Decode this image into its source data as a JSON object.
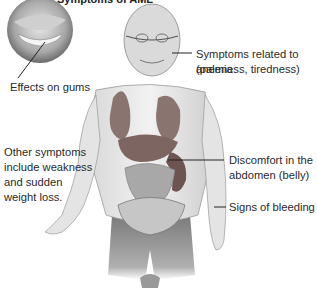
{
  "title": "Symptoms of AML",
  "labels": {
    "gums": "Effects on gums",
    "anemia_line1": "Symptoms related to anemia",
    "anemia_line2": "(paleness, tiredness)",
    "other_line1": "Other symptoms",
    "other_line2": "include weakness",
    "other_line3": "and sudden",
    "other_line4": "weight loss.",
    "abdomen_line1": "Discomfort in the",
    "abdomen_line2": "abdomen (belly)",
    "bleeding": "Signs of bleeding"
  },
  "colors": {
    "organ": "#8a7470",
    "text": "#2a2a2a",
    "body_shading": "#bcbcbc"
  }
}
